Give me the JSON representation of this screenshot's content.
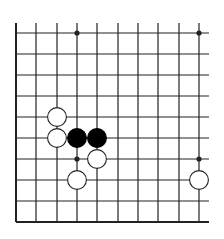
{
  "board": {
    "description": "Go board fragment (bottom-left corner region), 10 columns x 10 rows visible",
    "columns_x": [
      16,
      36,
      57,
      77,
      97,
      118,
      138,
      158,
      179,
      199
    ],
    "rows_y": [
      33,
      54,
      75,
      96,
      117,
      138,
      159,
      180,
      201,
      222
    ],
    "line_color": "#222222",
    "edge_left": true,
    "edge_bottom": true,
    "star_points": [
      {
        "col": 3,
        "row": 0
      },
      {
        "col": 9,
        "row": 0
      },
      {
        "col": 3,
        "row": 6
      },
      {
        "col": 9,
        "row": 6
      }
    ],
    "stones": [
      {
        "color": "white",
        "col": 2,
        "row": 4
      },
      {
        "color": "white",
        "col": 2,
        "row": 5
      },
      {
        "color": "black",
        "col": 3,
        "row": 5
      },
      {
        "color": "black",
        "col": 4,
        "row": 5
      },
      {
        "color": "white",
        "col": 4,
        "row": 6
      },
      {
        "color": "white",
        "col": 3,
        "row": 7
      },
      {
        "color": "white",
        "col": 9,
        "row": 7
      }
    ],
    "colors": {
      "black_stone": "#000000",
      "white_stone_fill": "#ffffff",
      "white_stone_stroke": "#222222",
      "background": "#ffffff"
    }
  }
}
